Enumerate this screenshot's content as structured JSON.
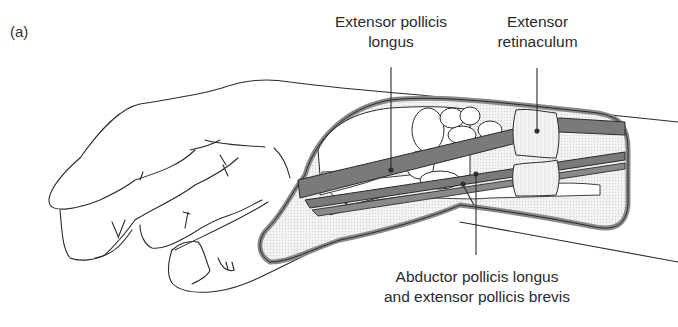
{
  "figure": {
    "panel_label": "(a)",
    "labels": {
      "epl": {
        "line1": "Extensor pollicis",
        "line2": "longus"
      },
      "retinaculum": {
        "line1": "Extensor",
        "line2": "retinaculum"
      },
      "apl_epb": {
        "line1": "Abductor pollicis longus",
        "line2": "and extensor pollicis brevis"
      }
    },
    "colors": {
      "outline": "#2b2b2b",
      "tendon": "#7a7a7a",
      "sheath": "#9a9a9a",
      "stipple": "#e4e4e4",
      "retinaculum": "#efefef",
      "text": "#2a2a2a"
    }
  }
}
